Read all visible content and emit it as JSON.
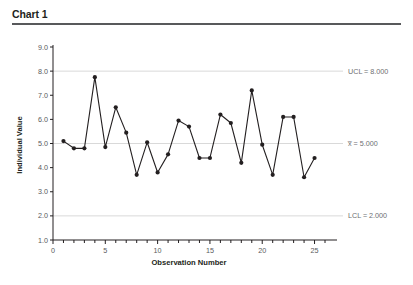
{
  "header": {
    "title": "Chart 1"
  },
  "chart_data": {
    "type": "line",
    "title": "Chart 1",
    "xlabel": "Observation Number",
    "ylabel": "Individual Value",
    "xlim": [
      0,
      26
    ],
    "ylim": [
      1.0,
      9.0
    ],
    "grid": false,
    "legend": "none",
    "x": [
      1,
      2,
      3,
      4,
      5,
      6,
      7,
      8,
      9,
      10,
      11,
      12,
      13,
      14,
      15,
      16,
      17,
      18,
      19,
      20,
      21,
      22,
      23,
      24,
      25
    ],
    "values": [
      5.1,
      4.8,
      4.8,
      7.75,
      4.85,
      6.5,
      5.45,
      3.7,
      5.05,
      3.8,
      4.55,
      5.95,
      5.7,
      4.4,
      4.4,
      6.2,
      5.85,
      4.2,
      7.2,
      4.95,
      3.7,
      6.1,
      6.1,
      3.6,
      4.4
    ],
    "series": [
      {
        "name": "Individual Value",
        "values": [
          5.1,
          4.8,
          4.8,
          7.75,
          4.85,
          6.5,
          5.45,
          3.7,
          5.05,
          3.8,
          4.55,
          5.95,
          5.7,
          4.4,
          4.4,
          6.2,
          5.85,
          4.2,
          7.2,
          4.95,
          3.7,
          6.1,
          6.1,
          3.6,
          4.4
        ]
      }
    ],
    "y_ticks": [
      "1.0",
      "2.0",
      "3.0",
      "4.0",
      "5.0",
      "6.0",
      "7.0",
      "8.0",
      "9.0"
    ],
    "y_tick_values": [
      1.0,
      2.0,
      3.0,
      4.0,
      5.0,
      6.0,
      7.0,
      8.0,
      9.0
    ],
    "x_ticks": [
      "0",
      "5",
      "10",
      "15",
      "20",
      "25"
    ],
    "x_tick_values": [
      0,
      5,
      10,
      15,
      20,
      25
    ],
    "x_minor_step": 1,
    "control_limits": [
      {
        "id": "ucl",
        "label": "UCL = 8.000",
        "value": 8.0
      },
      {
        "id": "center",
        "label": "x̅ = 5.000",
        "value": 5.0
      },
      {
        "id": "lcl",
        "label": "LCL = 2.000",
        "value": 2.0
      }
    ],
    "colors": {
      "series": "#231f20",
      "limit_line": "#d9d9d9",
      "axis": "#231f20",
      "limit_text": "#6d6e71",
      "title_rule": "#58595b",
      "background": "#ffffff"
    }
  }
}
